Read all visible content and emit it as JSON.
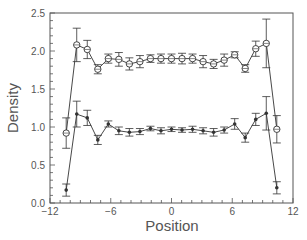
{
  "chart_data": {
    "type": "line",
    "title": "",
    "xlabel": "Position",
    "ylabel": "Density",
    "xlim": [
      -12,
      12
    ],
    "ylim": [
      0.0,
      2.5
    ],
    "x_ticks": [
      -12,
      -6,
      0,
      6,
      12
    ],
    "x_tick_labels": [
      "−12",
      "−6",
      "0",
      "6",
      "12"
    ],
    "y_ticks": [
      0.0,
      0.5,
      1.0,
      1.5,
      2.0,
      2.5
    ],
    "y_tick_labels": [
      "0.0",
      "0.5",
      "1.0",
      "1.5",
      "2.0",
      "2.5"
    ],
    "x_minor_step": 1,
    "y_minor_step": 0.1,
    "grid": false,
    "legend": null,
    "x": [
      -10.4,
      -9.36,
      -8.32,
      -7.28,
      -6.24,
      -5.2,
      -4.16,
      -3.12,
      -2.08,
      -1.04,
      0.0,
      1.04,
      2.08,
      3.12,
      4.16,
      5.2,
      6.24,
      7.28,
      8.32,
      9.36,
      10.4
    ],
    "series": [
      {
        "name": "open circles",
        "marker": "open-circle",
        "values": [
          0.92,
          2.08,
          2.02,
          1.76,
          1.9,
          1.89,
          1.83,
          1.86,
          1.9,
          1.9,
          1.9,
          1.9,
          1.9,
          1.86,
          1.83,
          1.88,
          1.95,
          1.77,
          2.03,
          2.1,
          0.97
        ],
        "errors": [
          0.2,
          0.22,
          0.12,
          0.06,
          0.06,
          0.09,
          0.08,
          0.08,
          0.05,
          0.06,
          0.06,
          0.07,
          0.06,
          0.08,
          0.06,
          0.08,
          0.04,
          0.05,
          0.1,
          0.32,
          0.18
        ]
      },
      {
        "name": "filled markers",
        "marker": "filled-star",
        "values": [
          0.17,
          1.17,
          1.12,
          0.83,
          1.04,
          0.95,
          0.93,
          0.94,
          0.98,
          0.95,
          0.97,
          0.96,
          0.97,
          0.95,
          0.93,
          0.96,
          1.04,
          0.86,
          1.1,
          1.18,
          0.2
        ],
        "errors": [
          0.08,
          0.17,
          0.1,
          0.06,
          0.04,
          0.05,
          0.05,
          0.04,
          0.03,
          0.04,
          0.03,
          0.03,
          0.04,
          0.04,
          0.05,
          0.04,
          0.07,
          0.06,
          0.08,
          0.22,
          0.08
        ]
      }
    ]
  },
  "colors": {
    "axis": "#555555",
    "line": "#333333",
    "background": "#ffffff"
  }
}
